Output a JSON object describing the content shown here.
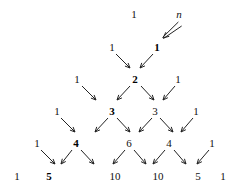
{
  "figure": {
    "annotation": {
      "label": "n",
      "style": "italic"
    },
    "colors": {
      "text": "#111111",
      "bold_text": "#000000",
      "arrow": "#222222",
      "background": "#ffffff"
    },
    "rows": [
      {
        "index": 0,
        "y": 14,
        "cells": [
          {
            "value": "1",
            "x": 134,
            "bold": false
          }
        ]
      },
      {
        "index": 1,
        "y": 47,
        "cells": [
          {
            "value": "1",
            "x": 112,
            "bold": false
          },
          {
            "value": "1",
            "x": 157,
            "bold": true
          }
        ]
      },
      {
        "index": 2,
        "y": 79,
        "cells": [
          {
            "value": "1",
            "x": 77,
            "bold": false
          },
          {
            "value": "2",
            "x": 135,
            "bold": true
          },
          {
            "value": "1",
            "x": 178,
            "bold": false
          }
        ]
      },
      {
        "index": 3,
        "y": 111,
        "cells": [
          {
            "value": "1",
            "x": 57,
            "bold": false
          },
          {
            "value": "3",
            "x": 112,
            "bold": true
          },
          {
            "value": "3",
            "x": 155,
            "bold": false
          },
          {
            "value": "1",
            "x": 196,
            "bold": false
          }
        ]
      },
      {
        "index": 4,
        "y": 143,
        "cells": [
          {
            "value": "1",
            "x": 37,
            "bold": false
          },
          {
            "value": "4",
            "x": 76,
            "bold": true
          },
          {
            "value": "6",
            "x": 129,
            "bold": false
          },
          {
            "value": "4",
            "x": 169,
            "bold": false
          },
          {
            "value": "1",
            "x": 212,
            "bold": false
          }
        ]
      },
      {
        "index": 5,
        "y": 176,
        "cells": [
          {
            "value": "1",
            "x": 17,
            "bold": false
          },
          {
            "value": "5",
            "x": 49,
            "bold": true
          },
          {
            "value": "10",
            "x": 115,
            "bold": false
          },
          {
            "value": "10",
            "x": 158,
            "bold": false
          },
          {
            "value": "5",
            "x": 198,
            "bold": false
          },
          {
            "value": "1",
            "x": 223,
            "bold": false
          }
        ]
      }
    ],
    "arrows": [
      {
        "name": "arrow-n-to-one",
        "x1": 180,
        "y1": 24,
        "x2": 163,
        "y2": 38,
        "double": true
      },
      {
        "name": "arrow-r1c0-to-r2c0",
        "x1": 116,
        "y1": 54,
        "x2": 130,
        "y2": 68
      },
      {
        "name": "arrow-r1c1-to-r2c0",
        "x1": 153,
        "y1": 54,
        "x2": 140,
        "y2": 68
      },
      {
        "name": "arrow-r2c0-to-r3c0",
        "x1": 82,
        "y1": 86,
        "x2": 96,
        "y2": 100
      },
      {
        "name": "arrow-r2c1-to-r3c0",
        "x1": 130,
        "y1": 86,
        "x2": 117,
        "y2": 100
      },
      {
        "name": "arrow-r2c1-to-r3c1",
        "x1": 141,
        "y1": 86,
        "x2": 154,
        "y2": 100
      },
      {
        "name": "arrow-r2c2-to-r3c1",
        "x1": 175,
        "y1": 86,
        "x2": 163,
        "y2": 100
      },
      {
        "name": "arrow-r3c0-to-r4c0",
        "x1": 61,
        "y1": 118,
        "x2": 75,
        "y2": 132
      },
      {
        "name": "arrow-r3c1-to-r4c0",
        "x1": 108,
        "y1": 118,
        "x2": 95,
        "y2": 132
      },
      {
        "name": "arrow-r3c1-to-r4c1",
        "x1": 117,
        "y1": 118,
        "x2": 130,
        "y2": 132
      },
      {
        "name": "arrow-r3c2-to-r4c1",
        "x1": 152,
        "y1": 118,
        "x2": 139,
        "y2": 132
      },
      {
        "name": "arrow-r3c2-to-r4c2",
        "x1": 160,
        "y1": 118,
        "x2": 173,
        "y2": 132
      },
      {
        "name": "arrow-r3c3-to-r4c2",
        "x1": 193,
        "y1": 118,
        "x2": 181,
        "y2": 132
      },
      {
        "name": "arrow-r4c0-to-r5c0",
        "x1": 41,
        "y1": 150,
        "x2": 55,
        "y2": 164
      },
      {
        "name": "arrow-r4c1-to-r5c0",
        "x1": 72,
        "y1": 150,
        "x2": 61,
        "y2": 164
      },
      {
        "name": "arrow-r4c1-to-r5c1",
        "x1": 81,
        "y1": 150,
        "x2": 94,
        "y2": 164
      },
      {
        "name": "arrow-r4c2-to-r5c1",
        "x1": 125,
        "y1": 150,
        "x2": 113,
        "y2": 164
      },
      {
        "name": "arrow-r4c2-to-r5c2",
        "x1": 134,
        "y1": 150,
        "x2": 146,
        "y2": 164
      },
      {
        "name": "arrow-r4c3-to-r5c2",
        "x1": 165,
        "y1": 150,
        "x2": 153,
        "y2": 164
      },
      {
        "name": "arrow-r4c3-to-r5c3",
        "x1": 174,
        "y1": 150,
        "x2": 186,
        "y2": 164
      },
      {
        "name": "arrow-r4c4-to-r5c3",
        "x1": 209,
        "y1": 150,
        "x2": 197,
        "y2": 164
      }
    ],
    "annotation_pos": {
      "x": 179,
      "y": 14
    }
  }
}
